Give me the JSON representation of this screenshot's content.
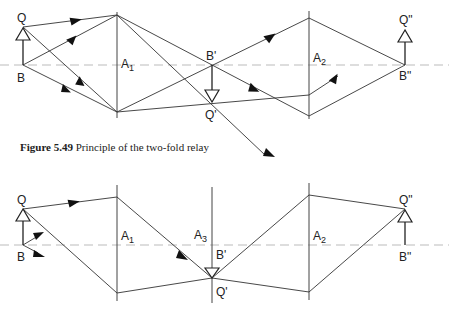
{
  "caption": {
    "number": "Figure 5.49",
    "text": " Principle of the two-fold relay"
  },
  "top_diagram": {
    "labels": {
      "object_top": "Q",
      "object_base": "B",
      "lens1": "A",
      "lens1_sub": "1",
      "image1_base": "B'",
      "image1_top": "Q'",
      "lens2": "A",
      "lens2_sub": "2",
      "image2_top": "Q\"",
      "image2_base": "B\""
    }
  },
  "bottom_diagram": {
    "labels": {
      "object_top": "Q",
      "object_base": "B",
      "lens1": "A",
      "lens1_sub": "1",
      "lens3": "A",
      "lens3_sub": "3",
      "image1_base": "B'",
      "image1_top": "Q'",
      "lens2": "A",
      "lens2_sub": "2",
      "image2_top": "Q\"",
      "image2_base": "B\""
    }
  }
}
